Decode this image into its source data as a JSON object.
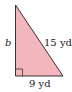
{
  "diagram": {
    "type": "right-triangle",
    "fill_color": "#f4b6bd",
    "stroke_color": "#333333",
    "labels": {
      "vertical_leg": "b",
      "hypotenuse": "15 yd",
      "horizontal_leg": "9 yd"
    },
    "right_angle_marker": true
  }
}
